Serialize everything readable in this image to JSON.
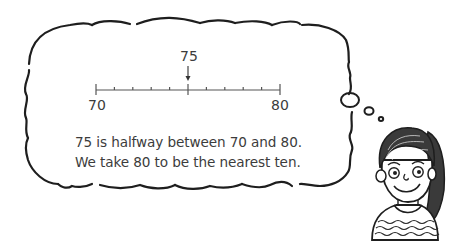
{
  "number_line": {
    "start_label": "70",
    "end_label": "80",
    "marked_label": "75",
    "start_value": 70,
    "end_value": 80,
    "marked_value": 75,
    "tick_count": 11,
    "arrow_icon": "down-arrow-icon"
  },
  "caption": {
    "line1": "75 is halfway between 70 and 80.",
    "line2": "We take 80 to be the nearest ten."
  },
  "illustration": {
    "thought_bubble": "thought-cloud",
    "character": "girl-with-ponytail"
  },
  "colors": {
    "ink": "#1e1e1e",
    "text": "#3c3c3c",
    "background": "#ffffff"
  }
}
